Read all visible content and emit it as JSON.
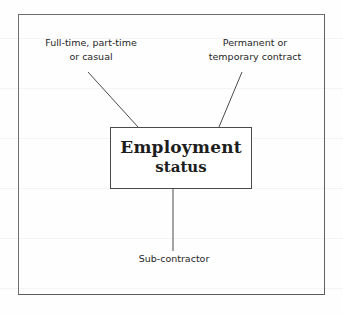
{
  "diagram": {
    "center_node": {
      "line1": "Employment",
      "line2": "status"
    },
    "annotations": [
      {
        "id": "employment-type",
        "line1": "Full-time, part-time",
        "line2": "or casual"
      },
      {
        "id": "contract-type",
        "line1": "Permanent or",
        "line2": "temporary contract"
      },
      {
        "id": "subcontractor",
        "line1": "Sub-contractor",
        "line2": ""
      }
    ],
    "colors": {
      "ink": "#1d1d1d",
      "frame": "#4a4a4a",
      "paper": "#fefefe"
    }
  }
}
